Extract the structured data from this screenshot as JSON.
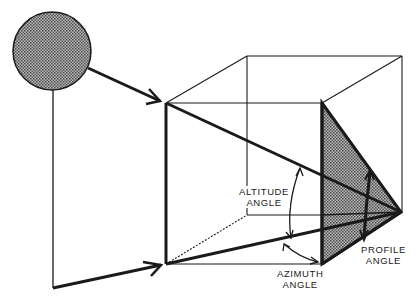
{
  "diagram": {
    "type": "solar-angle-geometry",
    "colors": {
      "ink": "#1a1a1a",
      "shade": "#8a8a8a",
      "background": "#ffffff"
    },
    "labels": {
      "altitude": {
        "line1": "ALTITUDE",
        "line2": "ANGLE"
      },
      "azimuth": {
        "line1": "AZIMUTH",
        "line2": "ANGLE"
      },
      "profile": {
        "line1": "PROFILE",
        "line2": "ANGLE"
      }
    },
    "elements": [
      {
        "name": "sun",
        "shape": "circle",
        "fill": "stippled-gray"
      },
      {
        "name": "box",
        "shape": "wireframe-cube"
      },
      {
        "name": "shaded-profile-plane",
        "shape": "triangle",
        "fill": "stippled-gray"
      },
      {
        "name": "sun-ray-arrow",
        "shape": "arrow"
      },
      {
        "name": "ground-projection-arrow",
        "shape": "arrow"
      }
    ]
  }
}
